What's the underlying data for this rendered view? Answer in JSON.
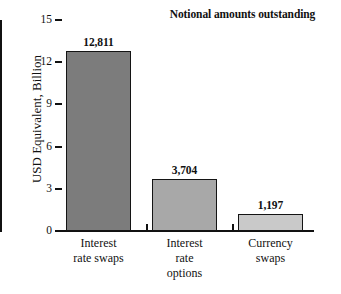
{
  "chart_data": {
    "type": "bar",
    "title": "Notional amounts outstanding",
    "xlabel": "",
    "ylabel": "USD Equivalent, Billion",
    "ylim": [
      0,
      15
    ],
    "yticks": [
      "0",
      "3",
      "6",
      "9",
      "12",
      "15"
    ],
    "grid": false,
    "legend": null,
    "categories": [
      "Interest rate swaps",
      "Interest rate options",
      "Currency swaps"
    ],
    "category_lines": [
      [
        "Interest",
        "rate swaps"
      ],
      [
        "Interest",
        "rate",
        "options"
      ],
      [
        "Currency",
        "swaps"
      ]
    ],
    "values": [
      12811,
      3704,
      1197
    ],
    "value_labels": [
      "12,811",
      "3,704",
      "1,197"
    ],
    "value_scale_note": "bar heights plotted in thousands against 0-15 axis",
    "bar_colors": [
      "#7c7c7c",
      "#a8a8a8",
      "#c9c9c9"
    ],
    "bar_border_color": "#141414",
    "axis_color": "#111111",
    "background_color": "#ffffff"
  }
}
